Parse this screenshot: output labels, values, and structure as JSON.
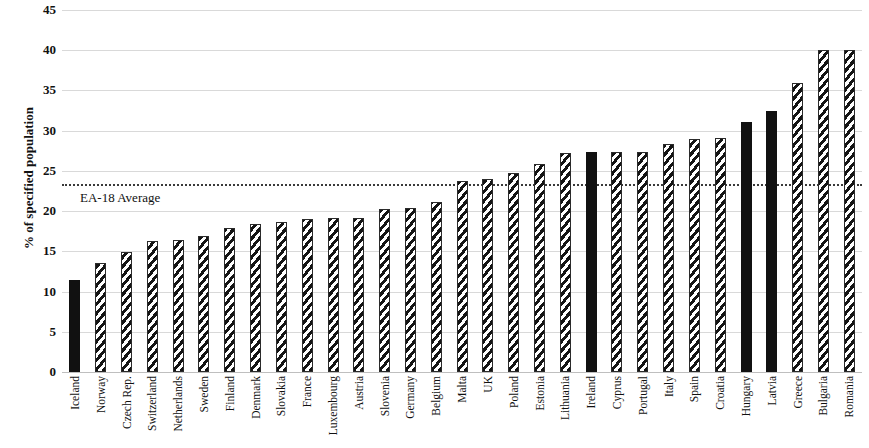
{
  "chart_data": {
    "type": "bar",
    "title": "",
    "xlabel": "",
    "ylabel": "% of specified population",
    "ylim": [
      0,
      45
    ],
    "ytick_step": 5,
    "yticks": [
      45,
      40,
      35,
      30,
      25,
      20,
      15,
      10,
      5,
      0
    ],
    "grid": true,
    "legend": "none",
    "categories": [
      "Iceland",
      "Norway",
      "Czech Rep.",
      "Switzerland",
      "Netherlands",
      "Sweden",
      "Finland",
      "Denmark",
      "Slovakia",
      "France",
      "Luxembourg",
      "Austria",
      "Slovenia",
      "Germany",
      "Belgium",
      "Malta",
      "UK",
      "Poland",
      "Estonia",
      "Lithuania",
      "Ireland",
      "Cyprus",
      "Portugal",
      "Italy",
      "Spain",
      "Croatia",
      "Hungary",
      "Latvia",
      "Greece",
      "Bulgaria",
      "Romania"
    ],
    "values": [
      11.4,
      13.6,
      14.9,
      16.3,
      16.4,
      16.9,
      17.9,
      18.4,
      18.6,
      19.0,
      19.1,
      19.2,
      20.3,
      20.4,
      21.1,
      23.8,
      24.0,
      24.7,
      25.9,
      27.2,
      27.3,
      27.3,
      27.4,
      28.3,
      29.0,
      29.1,
      31.1,
      32.4,
      35.9,
      40.0,
      40.0
    ],
    "bar_styles": [
      "solid",
      "hatch",
      "hatch",
      "hatch",
      "hatch",
      "hatch",
      "hatch",
      "hatch",
      "hatch",
      "hatch",
      "hatch",
      "hatch",
      "hatch",
      "hatch",
      "hatch",
      "hatch",
      "hatch",
      "hatch",
      "hatch",
      "hatch",
      "solid",
      "hatch",
      "hatch",
      "hatch",
      "hatch",
      "hatch",
      "solid",
      "solid",
      "hatch",
      "hatch",
      "hatch"
    ],
    "reference_line": {
      "label": "EA-18 Average",
      "value": 23.4,
      "style": "dotted",
      "color": "#3a3a3a"
    },
    "colors": {
      "solid_bar": "#111111",
      "hatch_stroke": "#141414",
      "hatch_background": "#ffffff",
      "gridline": "#d9d9d9",
      "text": "#111111"
    }
  }
}
